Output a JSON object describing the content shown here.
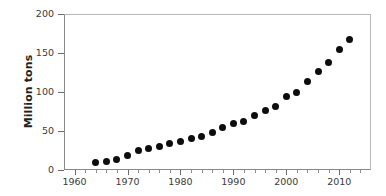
{
  "chart_data": {
    "type": "scatter",
    "title": "",
    "xlabel": "",
    "ylabel": "Million tons",
    "xlim": [
      1958,
      2016
    ],
    "ylim": [
      0,
      200
    ],
    "grid": false,
    "legend": null,
    "x_ticks": [
      1960,
      1970,
      1980,
      1990,
      2000,
      2010
    ],
    "x_tick_labels": [
      "1960",
      "1970",
      "1980",
      "1990",
      "2000",
      "2010"
    ],
    "x_minor_tick_interval": 2,
    "y_ticks": [
      0,
      50,
      100,
      150,
      200
    ],
    "y_tick_labels": [
      "0",
      "50",
      "100",
      "150",
      "200"
    ],
    "marker_color": "#0d0d0d",
    "marker_shape": "circle",
    "x": [
      1964,
      1966,
      1968,
      1970,
      1972,
      1974,
      1976,
      1978,
      1980,
      1982,
      1984,
      1986,
      1988,
      1990,
      1992,
      1994,
      1996,
      1998,
      2000,
      2002,
      2004,
      2006,
      2008,
      2010,
      2012
    ],
    "values": [
      10,
      11,
      13,
      18,
      25,
      27,
      30,
      34,
      37,
      41,
      43,
      48,
      54,
      59,
      62,
      70,
      76,
      82,
      94,
      100,
      113,
      126,
      138,
      154,
      167
    ],
    "series": [
      {
        "name": "series-1",
        "points": [
          [
            1964,
            10
          ],
          [
            1966,
            11
          ],
          [
            1968,
            13
          ],
          [
            1970,
            18
          ],
          [
            1972,
            25
          ],
          [
            1974,
            27
          ],
          [
            1976,
            30
          ],
          [
            1978,
            34
          ],
          [
            1980,
            37
          ],
          [
            1982,
            41
          ],
          [
            1984,
            43
          ],
          [
            1986,
            48
          ],
          [
            1988,
            54
          ],
          [
            1990,
            59
          ],
          [
            1992,
            62
          ],
          [
            1994,
            70
          ],
          [
            1996,
            76
          ],
          [
            1998,
            82
          ],
          [
            2000,
            94
          ],
          [
            2002,
            100
          ],
          [
            2004,
            113
          ],
          [
            2006,
            126
          ],
          [
            2008,
            138
          ],
          [
            2010,
            154
          ],
          [
            2012,
            167
          ]
        ]
      }
    ]
  }
}
